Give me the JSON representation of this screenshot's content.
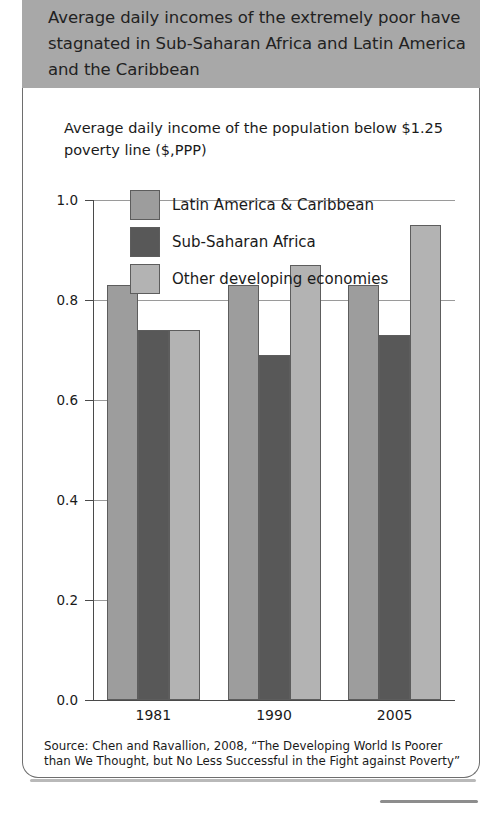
{
  "banner": {
    "title": "Average daily incomes of the extremely poor have stagnated in Sub-Saharan Africa and Latin America and the Caribbean",
    "background_color": "#a8a8a8"
  },
  "chart_data": {
    "type": "bar",
    "title": "Average daily income of the population below $1.25 poverty line ($,PPP)",
    "xlabel": "",
    "ylabel": "",
    "categories": [
      "1981",
      "1990",
      "2005"
    ],
    "series": [
      {
        "name": "Latin America & Caribbean",
        "color": "#9d9d9d",
        "values": [
          0.83,
          0.83,
          0.83
        ]
      },
      {
        "name": "Sub-Saharan Africa",
        "color": "#585858",
        "values": [
          0.74,
          0.69,
          0.73
        ]
      },
      {
        "name": "Other developing economies",
        "color": "#b3b3b3",
        "values": [
          0.74,
          0.87,
          0.95
        ]
      }
    ],
    "ylim": [
      0.0,
      1.0
    ],
    "yticks": [
      "0.0",
      "0.2",
      "0.4",
      "0.6",
      "0.8",
      "1.0"
    ],
    "ytick_values": [
      0.0,
      0.2,
      0.4,
      0.6,
      0.8,
      1.0
    ],
    "grid": true,
    "legend_position": "upper-center-inside"
  },
  "source": {
    "text": "Source: Chen and Ravallion, 2008, “The Developing World Is Poorer than We Thought, but No Less Successful in the Fight against Poverty”"
  }
}
